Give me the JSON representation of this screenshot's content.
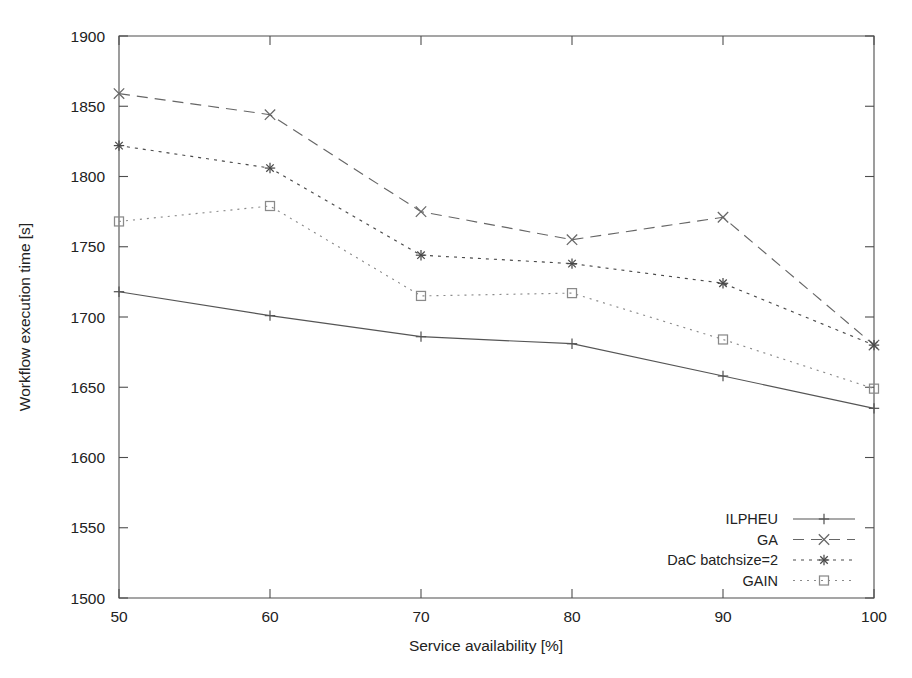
{
  "figure": {
    "clipped_caption": "",
    "background_color": "#ffffff",
    "ink_color": "#4d4d4d"
  },
  "chart_data": {
    "type": "line",
    "title": "",
    "xlabel": "Service availability [%]",
    "ylabel": "Workflow execution time [s]",
    "x": [
      50,
      60,
      70,
      80,
      90,
      100
    ],
    "xlim": [
      50,
      100
    ],
    "ylim": [
      1500,
      1900
    ],
    "xticks": [
      50,
      60,
      70,
      80,
      90,
      100
    ],
    "yticks": [
      1500,
      1550,
      1600,
      1650,
      1700,
      1750,
      1800,
      1850,
      1900
    ],
    "xtick_labels": [
      "50",
      "60",
      "70",
      "80",
      "90",
      "100"
    ],
    "ytick_labels": [
      "1500",
      "1550",
      "1600",
      "1650",
      "1700",
      "1750",
      "1800",
      "1850",
      "1900"
    ],
    "grid": false,
    "legend_position": "bottom-right",
    "series": [
      {
        "name": "ILPHEU",
        "values": [
          1718,
          1701,
          1686,
          1681,
          1658,
          1635
        ],
        "linestyle": "solid",
        "marker": "plus",
        "color": "#555555"
      },
      {
        "name": "GA",
        "values": [
          1859,
          1844,
          1775,
          1755,
          1771,
          1680
        ],
        "linestyle": "dashed",
        "marker": "cross",
        "color": "#666666"
      },
      {
        "name": "DaC batchsize=2",
        "values": [
          1822,
          1806,
          1744,
          1738,
          1724,
          1680
        ],
        "linestyle": "dotted-dense",
        "marker": "star",
        "color": "#4a4a4a"
      },
      {
        "name": "GAIN",
        "values": [
          1768,
          1779,
          1715,
          1717,
          1684,
          1649
        ],
        "linestyle": "dotted-fine",
        "marker": "square",
        "color": "#8a8a8a"
      }
    ]
  },
  "legend": {
    "entries": [
      {
        "label": "ILPHEU"
      },
      {
        "label": "GA"
      },
      {
        "label": "DaC batchsize=2"
      },
      {
        "label": "GAIN"
      }
    ]
  }
}
